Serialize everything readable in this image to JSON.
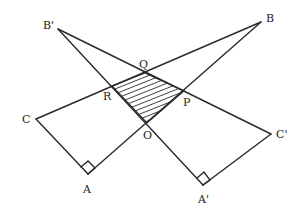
{
  "diagram": {
    "type": "geometry",
    "points": {
      "B_prime": {
        "label": "B'",
        "x": 58,
        "y": 29
      },
      "B": {
        "label": "B",
        "x": 261,
        "y": 22
      },
      "Q": {
        "label": "Q",
        "x": 145,
        "y": 73
      },
      "R": {
        "label": "R",
        "x": 112,
        "y": 86
      },
      "P": {
        "label": "P",
        "x": 184,
        "y": 91
      },
      "O": {
        "label": "O",
        "x": 147,
        "y": 123
      },
      "C": {
        "label": "C",
        "x": 36,
        "y": 119
      },
      "A": {
        "label": "A",
        "x": 88,
        "y": 174
      },
      "C_prime": {
        "label": "C'",
        "x": 271,
        "y": 134
      },
      "A_prime": {
        "label": "A'",
        "x": 203,
        "y": 185
      }
    },
    "right_angles": [
      "A",
      "A'"
    ],
    "shaded_region": [
      "Q",
      "P",
      "O",
      "R"
    ],
    "colors": {
      "stroke": "#2a2a2a",
      "background": "#ffffff"
    }
  }
}
